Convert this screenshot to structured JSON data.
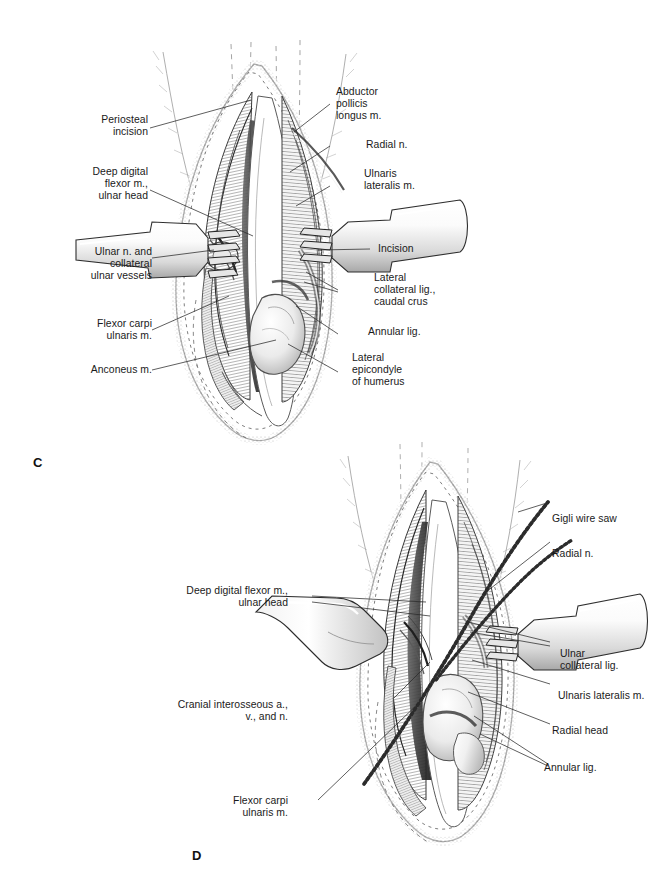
{
  "plate": {
    "background": "#ffffff",
    "ink": "#1a1a1a",
    "panels": [
      {
        "id": "C",
        "letter": "C"
      },
      {
        "id": "D",
        "letter": "D"
      }
    ]
  },
  "figure_c": {
    "letter": "C",
    "labels_left": [
      {
        "id": "periosteal-incision",
        "text": "Periosteal\nincision"
      },
      {
        "id": "deep-digital-flexor-ulnar-head",
        "text": "Deep digital\nflexor m.,\nulnar head"
      },
      {
        "id": "ulnar-nerve-collateral-vessels",
        "text": "Ulnar n. and\ncollateral\nulnar vessels"
      },
      {
        "id": "flexor-carpi-ulnaris",
        "text": "Flexor carpi\nulnaris m."
      },
      {
        "id": "anconeus",
        "text": "Anconeus m."
      }
    ],
    "labels_right": [
      {
        "id": "abductor-pollicis-longus",
        "text": "Abductor\npollicis\nlongus m."
      },
      {
        "id": "radial-nerve",
        "text": "Radial n."
      },
      {
        "id": "ulnaris-lateralis",
        "text": "Ulnaris\nlateralis m."
      },
      {
        "id": "incision",
        "text": "Incision"
      },
      {
        "id": "lateral-collateral-lig-caudal-crus",
        "text": "Lateral\ncollateral lig.,\ncaudal crus"
      },
      {
        "id": "annular-lig",
        "text": "Annular lig."
      },
      {
        "id": "lateral-epicondyle-humerus",
        "text": "Lateral\nepicondyle\nof humerus"
      }
    ]
  },
  "figure_d": {
    "letter": "D",
    "labels_left": [
      {
        "id": "deep-digital-flexor-ulnar-head",
        "text": "Deep digital flexor m.,\nulnar head"
      },
      {
        "id": "cranial-interosseous",
        "text": "Cranial interosseous a.,\nv., and n."
      },
      {
        "id": "flexor-carpi-ulnaris",
        "text": "Flexor carpi\nulnaris m."
      }
    ],
    "labels_right": [
      {
        "id": "gigli-wire-saw",
        "text": "Gigli wire saw"
      },
      {
        "id": "radial-nerve",
        "text": "Radial n."
      },
      {
        "id": "ulnar-collateral-lig",
        "text": "Ulnar\ncollateral lig."
      },
      {
        "id": "ulnaris-lateralis",
        "text": "Ulnaris lateralis m."
      },
      {
        "id": "radial-head",
        "text": "Radial head"
      },
      {
        "id": "annular-lig",
        "text": "Annular lig."
      }
    ]
  }
}
